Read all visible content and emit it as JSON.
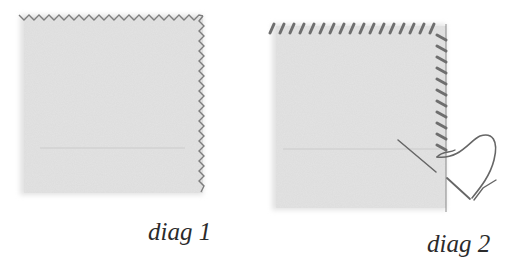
{
  "diagrams": [
    {
      "id": "diag1",
      "label": "diag 1",
      "description": "Fabric square with zigzag-stitched top and right edges"
    },
    {
      "id": "diag2",
      "label": "diag 2",
      "description": "Fabric square with overcast stitches on top and right edges, needle and thread"
    }
  ],
  "colors": {
    "fabric": "#e3e3e3",
    "stitch": "#7a7a7a",
    "thread": "#6a6a6a",
    "text": "#2b2b2b"
  }
}
